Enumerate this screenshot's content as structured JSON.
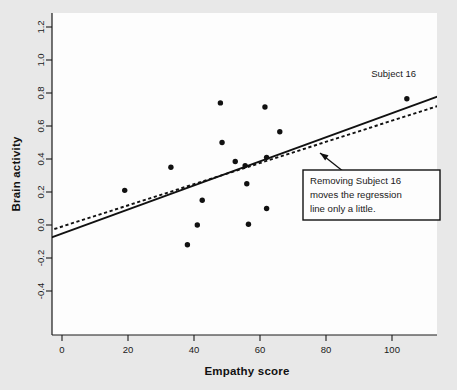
{
  "figure": {
    "background_color": "#e8e8e8",
    "plot_background_color": "#fdfdfd",
    "axis_color": "#1a1a1a",
    "point_color": "#111111"
  },
  "chart_data": {
    "type": "scatter",
    "title": "",
    "xlabel": "Empathy score",
    "ylabel": "Brain activity",
    "xlim": [
      -4,
      116
    ],
    "ylim": [
      -0.52,
      1.29
    ],
    "grid": false,
    "legend_position": "none",
    "xticks": [
      0,
      20,
      40,
      60,
      80,
      100
    ],
    "xtick_labels": [
      "0",
      "20",
      "40",
      "60",
      "80",
      "100"
    ],
    "yticks": [
      -0.4,
      -0.2,
      0.0,
      0.2,
      0.4,
      0.6,
      0.8,
      1.0,
      1.2
    ],
    "ytick_labels": [
      "-0.4",
      "-0.2",
      "0.0",
      "0.2",
      "0.4",
      "0.6",
      "0.8",
      "1.0",
      "1.2"
    ],
    "points": [
      {
        "x": 19,
        "y": 0.21
      },
      {
        "x": 33,
        "y": 0.35
      },
      {
        "x": 38,
        "y": -0.12
      },
      {
        "x": 41,
        "y": 0.0
      },
      {
        "x": 42.5,
        "y": 0.15
      },
      {
        "x": 48,
        "y": 0.74
      },
      {
        "x": 48.5,
        "y": 0.5
      },
      {
        "x": 52.5,
        "y": 0.385
      },
      {
        "x": 55.5,
        "y": 0.36
      },
      {
        "x": 56,
        "y": 0.25
      },
      {
        "x": 56.5,
        "y": 0.005
      },
      {
        "x": 61.5,
        "y": 0.715
      },
      {
        "x": 62,
        "y": 0.41
      },
      {
        "x": 62,
        "y": 0.1
      },
      {
        "x": 66,
        "y": 0.565
      },
      {
        "x": 104.5,
        "y": 0.765
      }
    ],
    "series": [
      {
        "name": "regression-line-all-subjects",
        "style": "solid",
        "x": [
          -4,
          116
        ],
        "y": [
          -0.082,
          0.795
        ]
      },
      {
        "name": "regression-line-without-subject-16",
        "style": "dashed",
        "x": [
          -4,
          116
        ],
        "y": [
          -0.035,
          0.735
        ]
      }
    ],
    "annotations": [
      {
        "name": "subject-16-label",
        "text": "Subject 16",
        "x": 100.5,
        "y": 0.9
      },
      {
        "name": "callout-box",
        "lines": [
          "Removing Subject 16",
          "moves the regression",
          "line only a little."
        ],
        "target": {
          "x": 89.5,
          "y": 0.555
        }
      }
    ]
  }
}
